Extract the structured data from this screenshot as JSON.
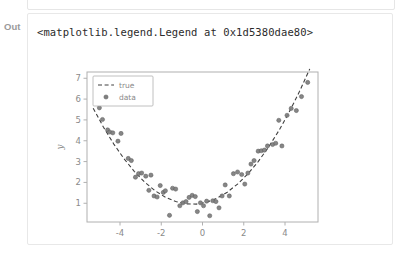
{
  "cell": {
    "prompt_label": "Out",
    "repr_text": "<matplotlib.legend.Legend at 0x1d5380dae80>"
  },
  "colors": {
    "text": "#2b2b2b",
    "prompt": "#9a9a9a",
    "cell_border": "#e8e8e8",
    "marker": "#7f7f7f",
    "marker_edge": "#5a5a5a",
    "line": "#404040",
    "spine": "#b0b0b0",
    "tick_label": "#8a8a8a"
  },
  "chart_data": {
    "type": "scatter",
    "title": "",
    "xlabel": "x",
    "ylabel": "y",
    "xlim": [
      -5.6,
      5.6
    ],
    "ylim": [
      0.1,
      7.3
    ],
    "xticks": [
      -4,
      -2,
      0,
      2,
      4
    ],
    "yticks": [
      1,
      2,
      3,
      4,
      5,
      6,
      7
    ],
    "grid": false,
    "legend": {
      "position": "upper left",
      "entries": [
        {
          "label": "true",
          "style": "dashed-line"
        },
        {
          "label": "data",
          "style": "marker"
        }
      ]
    },
    "series": [
      {
        "name": "true",
        "type": "line",
        "style": "dashed",
        "formula": "y = 0.2*x^2 + 0.2*x + 1.0",
        "x": [
          -5.3,
          -4.8,
          -4.3,
          -3.8,
          -3.3,
          -2.8,
          -2.3,
          -1.8,
          -1.3,
          -0.8,
          -0.3,
          0.2,
          0.7,
          1.2,
          1.7,
          2.2,
          2.7,
          3.2,
          3.7,
          4.2,
          4.7,
          5.2
        ],
        "y": [
          5.56,
          4.65,
          3.84,
          3.13,
          2.52,
          2.01,
          1.6,
          1.29,
          1.08,
          0.97,
          0.96,
          1.05,
          1.24,
          1.53,
          1.92,
          2.41,
          3.0,
          3.69,
          4.48,
          5.37,
          6.36,
          7.45
        ]
      },
      {
        "name": "data",
        "type": "scatter",
        "x": [
          -5.0,
          -4.85,
          -4.6,
          -4.5,
          -4.35,
          -4.1,
          -3.95,
          -3.6,
          -3.45,
          -3.25,
          -3.1,
          -2.95,
          -2.75,
          -2.6,
          -2.5,
          -2.35,
          -2.2,
          -2.05,
          -1.9,
          -1.8,
          -1.6,
          -1.45,
          -1.3,
          -1.1,
          -0.95,
          -0.8,
          -0.65,
          -0.5,
          -0.35,
          -0.25,
          -0.1,
          0.05,
          0.2,
          0.35,
          0.5,
          0.65,
          0.8,
          0.95,
          1.1,
          1.3,
          1.5,
          1.7,
          1.9,
          2.05,
          2.2,
          2.35,
          2.5,
          2.7,
          2.85,
          3.0,
          3.15,
          3.4,
          3.55,
          3.7,
          3.85,
          4.1,
          4.3,
          4.55,
          4.8,
          5.1
        ],
        "y": [
          5.58,
          5.02,
          4.52,
          4.42,
          4.38,
          3.98,
          4.35,
          3.15,
          3.05,
          2.25,
          2.42,
          2.45,
          2.3,
          1.62,
          2.35,
          1.35,
          1.3,
          1.85,
          1.52,
          1.6,
          0.42,
          1.72,
          1.68,
          0.88,
          1.02,
          1.08,
          1.28,
          1.38,
          1.32,
          0.6,
          1.02,
          0.88,
          1.1,
          0.4,
          1.12,
          1.08,
          0.78,
          1.35,
          1.88,
          1.35,
          2.42,
          2.5,
          2.38,
          1.92,
          2.45,
          2.88,
          3.05,
          3.5,
          3.52,
          3.55,
          3.75,
          3.82,
          3.88,
          4.98,
          3.75,
          5.22,
          5.55,
          5.45,
          6.12,
          6.8
        ]
      }
    ]
  }
}
